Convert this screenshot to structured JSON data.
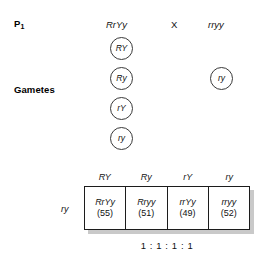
{
  "labels": {
    "p1": "P",
    "p1_subscript": "1",
    "gametes": "Gametes"
  },
  "parents": {
    "left_genotype": "RrYy",
    "cross_symbol": "X",
    "right_genotype": "rryy"
  },
  "gametes": {
    "left": [
      "RY",
      "Ry",
      "rY",
      "ry"
    ],
    "right": [
      "ry"
    ]
  },
  "punnett": {
    "column_headers": [
      "RY",
      "Ry",
      "rY",
      "ry"
    ],
    "row_header": "ry",
    "cells": [
      {
        "genotype": "RrYy",
        "count": "(55)"
      },
      {
        "genotype": "Rryy",
        "count": "(51)"
      },
      {
        "genotype": "rrYy",
        "count": "(49)"
      },
      {
        "genotype": "rryy",
        "count": "(52)"
      }
    ]
  },
  "ratio": "1 : 1 : 1 : 1",
  "colors": {
    "text": "#111111",
    "border": "#1c1c1c",
    "shadow": "#c9c9c9",
    "circle_stroke": "#3a3a3a",
    "background": "#ffffff"
  },
  "chart_data": {
    "type": "table",
    "categories": [
      "RrYy",
      "Rryy",
      "rrYy",
      "rryy"
    ],
    "values": [
      55,
      51,
      49,
      52
    ],
    "xlabel": "Offspring genotype",
    "ylabel": "Observed count",
    "annotations": [
      "1 : 1 : 1 : 1"
    ]
  }
}
